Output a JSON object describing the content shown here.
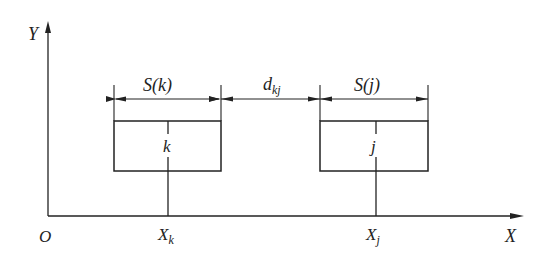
{
  "diagram": {
    "axes": {
      "y_label": "Y",
      "x_label": "X",
      "origin_label": "O"
    },
    "boxes": [
      {
        "id": "k",
        "label": "k",
        "width_label": "S(k)",
        "position_label": "X",
        "position_sub": "k"
      },
      {
        "id": "j",
        "label": "j",
        "width_label": "S(j)",
        "position_label": "X",
        "position_sub": "j"
      }
    ],
    "gap": {
      "label": "d",
      "sub": "kj"
    },
    "colors": {
      "stroke": "#222222",
      "background": "#ffffff"
    }
  }
}
